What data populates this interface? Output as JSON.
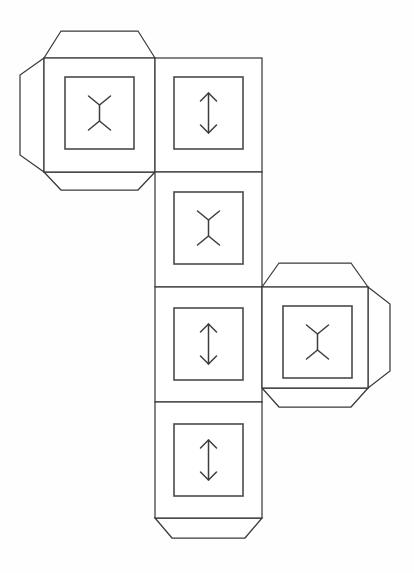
{
  "figure": {
    "type": "cube-net-foldable",
    "background_color": "#fefefe",
    "line_color": "#3a3a3a",
    "inner_frame_color": "#4a4a4a",
    "glyph_color": "#3c3c3c",
    "canvas": {
      "width": 414,
      "height": 573
    }
  },
  "layout": {
    "cell_size": 107,
    "tab_depth": 22,
    "tab_taper": 17,
    "columns": [
      {
        "name": "left-column",
        "x": 44
      },
      {
        "name": "center-column",
        "x": 155
      },
      {
        "name": "right-column",
        "x": 262
      }
    ],
    "rows": [
      {
        "name": "row-1",
        "y": 58
      },
      {
        "name": "row-2",
        "y": 172
      },
      {
        "name": "row-3",
        "y": 287
      },
      {
        "name": "row-4",
        "y": 402
      }
    ]
  },
  "faces": [
    {
      "id": "face-top-left",
      "label": "Top-left face",
      "grid": {
        "col": 0,
        "row": 0
      },
      "rect": {
        "x": 44,
        "y": 58,
        "w": 111,
        "h": 114
      },
      "inner": {
        "x": 65,
        "y": 77,
        "w": 69,
        "h": 72
      },
      "glyph": "i-beam-glyph",
      "glyph_name": "i-beam",
      "tabs": [
        "top",
        "left",
        "bottom"
      ]
    },
    {
      "id": "face-center-top",
      "label": "Center top face",
      "grid": {
        "col": 1,
        "row": 0
      },
      "rect": {
        "x": 155,
        "y": 58,
        "w": 107,
        "h": 114
      },
      "inner": {
        "x": 174,
        "y": 77,
        "w": 69,
        "h": 72
      },
      "glyph": "double-arrow-glyph",
      "glyph_name": "double-headed-arrow",
      "tabs": []
    },
    {
      "id": "face-center-upper-middle",
      "label": "Center upper-middle face",
      "grid": {
        "col": 1,
        "row": 1
      },
      "rect": {
        "x": 155,
        "y": 172,
        "w": 107,
        "h": 115
      },
      "inner": {
        "x": 174,
        "y": 192,
        "w": 69,
        "h": 72
      },
      "glyph": "i-beam-glyph",
      "glyph_name": "i-beam",
      "tabs": []
    },
    {
      "id": "face-center-lower-middle",
      "label": "Center lower-middle face",
      "grid": {
        "col": 1,
        "row": 2
      },
      "rect": {
        "x": 155,
        "y": 287,
        "w": 107,
        "h": 115
      },
      "inner": {
        "x": 174,
        "y": 308,
        "w": 69,
        "h": 72
      },
      "glyph": "double-arrow-glyph",
      "glyph_name": "double-headed-arrow",
      "tabs": []
    },
    {
      "id": "face-center-bottom",
      "label": "Center bottom face",
      "grid": {
        "col": 1,
        "row": 3
      },
      "rect": {
        "x": 155,
        "y": 402,
        "w": 107,
        "h": 116
      },
      "inner": {
        "x": 174,
        "y": 424,
        "w": 69,
        "h": 72
      },
      "glyph": "double-arrow-glyph",
      "glyph_name": "double-headed-arrow",
      "tabs": [
        "bottom"
      ]
    },
    {
      "id": "face-right",
      "label": "Right face",
      "grid": {
        "col": 2,
        "row": 2
      },
      "rect": {
        "x": 262,
        "y": 287,
        "w": 106,
        "h": 101
      },
      "inner": {
        "x": 283,
        "y": 306,
        "w": 69,
        "h": 72
      },
      "glyph": "i-beam-glyph",
      "glyph_name": "i-beam",
      "tabs": [
        "top",
        "right",
        "bottom"
      ]
    }
  ],
  "tabs": [
    {
      "id": "tab-top-left-top",
      "attached_to": "face-top-left",
      "side": "top",
      "points": "44,58 61,31 138,31 155,58"
    },
    {
      "id": "tab-top-left-left",
      "attached_to": "face-top-left",
      "side": "left",
      "points": "44,58 20,75 20,155 44,172"
    },
    {
      "id": "tab-top-left-bottom",
      "attached_to": "face-top-left",
      "side": "bottom",
      "points": "44,172 61,190 138,190 155,172"
    },
    {
      "id": "tab-right-top",
      "attached_to": "face-right",
      "side": "top",
      "points": "262,287 279,263 351,263 368,287"
    },
    {
      "id": "tab-right-right",
      "attached_to": "face-right",
      "side": "right",
      "points": "368,287 390,304 390,371 368,388"
    },
    {
      "id": "tab-right-bottom",
      "attached_to": "face-right",
      "side": "bottom",
      "points": "262,388 279,407 351,407 368,388"
    },
    {
      "id": "tab-center-bottom",
      "attached_to": "face-center-bottom",
      "side": "bottom",
      "points": "155,518 172,538 245,538 262,518"
    }
  ],
  "glyphs": {
    "i-beam": {
      "description": "Vertical stem with V-shaped forks at top and bottom",
      "paths": [
        "M -11 -17 L 0 -8 L 11 -17",
        "M 0 -8 L 0 8",
        "M -11 17 L 0 8 L 11 17"
      ]
    },
    "double-headed-arrow": {
      "description": "Vertical line with arrowheads at both ends",
      "paths": [
        "M 0 -20 L 0 20",
        "M -8 -12 L 0 -20 L 8 -12",
        "M -8 12 L 0 20 L 8 12"
      ]
    }
  }
}
